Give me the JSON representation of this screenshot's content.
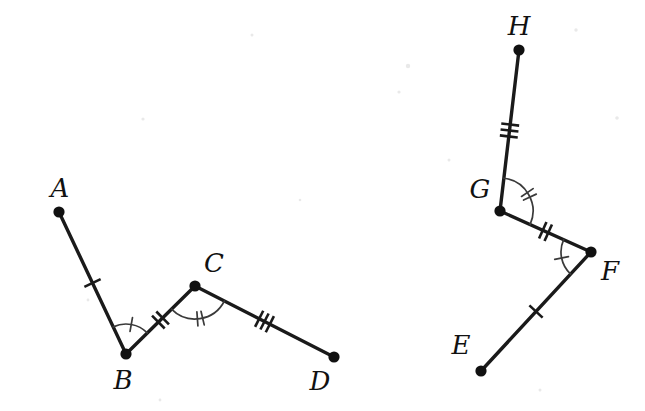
{
  "diagram": {
    "background_color": "#ffffff",
    "stroke_color": "#1a1a1a",
    "label_color": "#111111",
    "figures": [
      {
        "id": "figure-left",
        "name": "path-ABCD",
        "vertices": [
          {
            "label": "A",
            "x": 59,
            "y": 212,
            "label_x": 60,
            "label_y": 190
          },
          {
            "label": "B",
            "x": 126,
            "y": 354,
            "label_x": 123,
            "label_y": 382
          },
          {
            "label": "C",
            "x": 195,
            "y": 286,
            "label_x": 214,
            "label_y": 265
          },
          {
            "label": "D",
            "x": 334,
            "y": 357,
            "label_x": 320,
            "label_y": 383
          }
        ],
        "segments": [
          {
            "name": "segment-AB",
            "from": "A",
            "to": "B",
            "ticks": 1
          },
          {
            "name": "segment-BC",
            "from": "B",
            "to": "C",
            "ticks": 2
          },
          {
            "name": "segment-CD",
            "from": "C",
            "to": "D",
            "ticks": 3
          }
        ],
        "angles": [
          {
            "name": "angle-B",
            "vertex": "B",
            "arms": [
              "A",
              "C"
            ],
            "arc_ticks": 1,
            "radius": 30
          },
          {
            "name": "angle-C",
            "vertex": "C",
            "arms": [
              "B",
              "D"
            ],
            "arc_ticks": 2,
            "radius": 33
          }
        ]
      },
      {
        "id": "figure-right",
        "name": "path-EFGH",
        "vertices": [
          {
            "label": "E",
            "x": 481,
            "y": 371,
            "label_x": 461,
            "label_y": 347
          },
          {
            "label": "F",
            "x": 591,
            "y": 252,
            "label_x": 610,
            "label_y": 273
          },
          {
            "label": "G",
            "x": 500,
            "y": 211,
            "label_x": 480,
            "label_y": 191
          },
          {
            "label": "H",
            "x": 519,
            "y": 50,
            "label_x": 519,
            "label_y": 28
          }
        ],
        "segments": [
          {
            "name": "segment-EF",
            "from": "E",
            "to": "F",
            "ticks": 1
          },
          {
            "name": "segment-FG",
            "from": "F",
            "to": "G",
            "ticks": 2
          },
          {
            "name": "segment-GH",
            "from": "G",
            "to": "H",
            "ticks": 3
          }
        ],
        "angles": [
          {
            "name": "angle-F",
            "vertex": "F",
            "arms": [
              "E",
              "G"
            ],
            "arc_ticks": 1,
            "radius": 30
          },
          {
            "name": "angle-G",
            "vertex": "G",
            "arms": [
              "F",
              "H"
            ],
            "arc_ticks": 2,
            "radius": 33
          }
        ]
      }
    ]
  }
}
